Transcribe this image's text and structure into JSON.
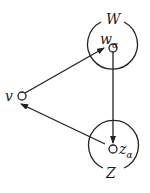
{
  "diagram": {
    "nodes": [
      {
        "id": "v",
        "label": "v"
      },
      {
        "id": "w_alpha",
        "label": "w",
        "subscript": "α"
      },
      {
        "id": "z_alpha",
        "label": "z",
        "subscript": "α"
      }
    ],
    "regions": [
      {
        "id": "W",
        "label": "W"
      },
      {
        "id": "Z",
        "label": "Z"
      }
    ],
    "edges": [
      {
        "from": "v",
        "to": "w_alpha"
      },
      {
        "from": "w_alpha",
        "to": "z_alpha"
      },
      {
        "from": "z_alpha",
        "to": "v"
      }
    ],
    "colors": {
      "stroke": "#222222",
      "background": "#ffffff"
    }
  }
}
